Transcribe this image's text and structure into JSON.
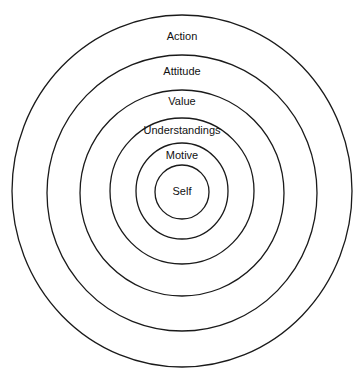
{
  "diagram": {
    "type": "concentric-circles",
    "layers": [
      {
        "label": "Action",
        "cx": 182,
        "cy": 191,
        "rx": 170,
        "ry": 176,
        "label_y": 40
      },
      {
        "label": "Attitude",
        "cx": 182,
        "cy": 193,
        "rx": 135,
        "ry": 138,
        "label_y": 75
      },
      {
        "label": "Value",
        "cx": 182,
        "cy": 193,
        "rx": 102,
        "ry": 103,
        "label_y": 105
      },
      {
        "label": "Understandings",
        "cx": 182,
        "cy": 191,
        "rx": 72,
        "ry": 73,
        "label_y": 134
      },
      {
        "label": "Motive",
        "cx": 182,
        "cy": 191,
        "rx": 46,
        "ry": 48,
        "label_y": 159
      },
      {
        "label": "Self",
        "cx": 182,
        "cy": 192,
        "rx": 27,
        "ry": 27,
        "label_y": 195
      }
    ],
    "stroke_color": "#1a1a1a",
    "background": "#ffffff"
  }
}
